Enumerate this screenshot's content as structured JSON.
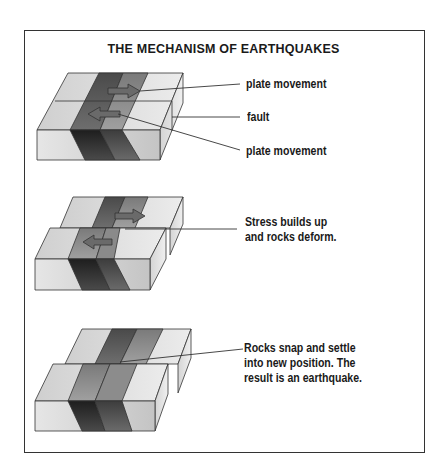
{
  "title": "THE MECHANISM OF EARTHQUAKES",
  "stages": [
    {
      "id": "stage-1",
      "labels": [
        {
          "text": "plate movement"
        },
        {
          "text": "fault"
        },
        {
          "text": "plate movement"
        }
      ]
    },
    {
      "id": "stage-2",
      "labels": [
        {
          "line1": "Stress builds up",
          "line2": "and rocks deform."
        }
      ]
    },
    {
      "id": "stage-3",
      "labels": [
        {
          "line1": "Rocks snap and settle",
          "line2": "into new position. The",
          "line3": "result is an earthquake."
        }
      ]
    }
  ],
  "colors": {
    "border": "#333333",
    "light": "#d8d8d8",
    "mid": "#8a8a8a",
    "dark": "#555555",
    "darkest": "#2e2e2e"
  }
}
